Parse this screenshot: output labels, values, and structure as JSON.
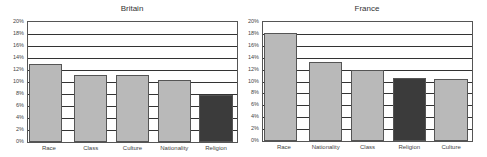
{
  "chart_data": [
    {
      "type": "bar",
      "title": "Britain",
      "categories": [
        "Race",
        "Class",
        "Culture",
        "Nationality",
        "Religion"
      ],
      "values": [
        13.0,
        11.2,
        11.2,
        10.3,
        7.8
      ],
      "highlight": "Religion",
      "xlabel": "",
      "ylabel": "",
      "ylim": [
        0,
        20
      ],
      "yticks": [
        "0%",
        "2%",
        "4%",
        "6%",
        "8%",
        "10%",
        "12%",
        "14%",
        "16%",
        "18%",
        "20%"
      ],
      "grid": true,
      "legend": null
    },
    {
      "type": "bar",
      "title": "France",
      "categories": [
        "Race",
        "Nationality",
        "Class",
        "Religion",
        "Culture"
      ],
      "values": [
        18.2,
        13.2,
        11.9,
        10.6,
        10.4
      ],
      "highlight": "Religion",
      "xlabel": "",
      "ylabel": "",
      "ylim": [
        0,
        20
      ],
      "yticks": [
        "0%",
        "2%",
        "4%",
        "6%",
        "8%",
        "10%",
        "12%",
        "14%",
        "16%",
        "18%",
        "20%"
      ],
      "grid": true,
      "legend": null
    }
  ],
  "colors": {
    "bar": "#b9b9b9",
    "highlight": "#3b3b3b",
    "grid": "#333333"
  },
  "charts": [
    {
      "title": "Britain"
    },
    {
      "title": "France"
    }
  ]
}
